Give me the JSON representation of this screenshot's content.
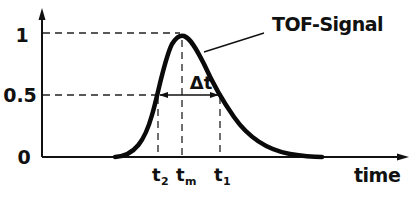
{
  "diagram": {
    "title": "TOF-Signal",
    "y_axis": {
      "ticks": [
        "1",
        "0.5",
        "0"
      ]
    },
    "x_axis": {
      "label": "time"
    },
    "width_label": "Δt",
    "markers": [
      {
        "base": "t",
        "sub": "2"
      },
      {
        "base": "t",
        "sub": "m"
      },
      {
        "base": "t",
        "sub": "1"
      }
    ],
    "colors": {
      "line": "#111111",
      "background": "#ffffff"
    }
  }
}
